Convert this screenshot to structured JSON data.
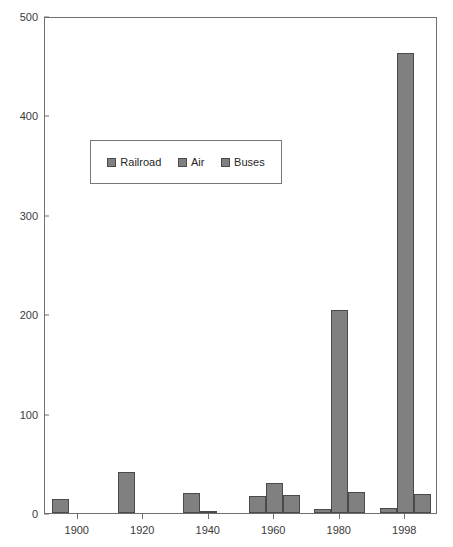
{
  "chart_data": {
    "type": "bar",
    "title": "",
    "xlabel": "",
    "ylabel": "",
    "ylim": [
      0,
      500
    ],
    "y_ticks": [
      0,
      100,
      200,
      300,
      400,
      500
    ],
    "grid": false,
    "legend_position": "upper-left-inside",
    "categories": [
      "1900",
      "1920",
      "1940",
      "1960",
      "1980",
      "1998"
    ],
    "series": [
      {
        "name": "Railroad",
        "color": "#808080",
        "values": [
          14,
          41,
          20,
          17,
          4,
          5
        ]
      },
      {
        "name": "Air",
        "color": "#808080",
        "values": [
          0,
          0,
          1,
          30,
          204,
          463
        ]
      },
      {
        "name": "Buses",
        "color": "#808080",
        "values": [
          0,
          0,
          0,
          18,
          21,
          19
        ]
      }
    ]
  },
  "axes": {
    "y_tick_labels": [
      "0",
      "100",
      "200",
      "300",
      "400",
      "500"
    ],
    "x_tick_labels": [
      "1900",
      "1920",
      "1940",
      "1960",
      "1980",
      "1998"
    ]
  },
  "legend": {
    "items": [
      {
        "label": "Railroad"
      },
      {
        "label": "Air"
      },
      {
        "label": "Buses"
      }
    ]
  },
  "title_strip": {
    "text": ""
  },
  "colors": {
    "bar_fill": "#808080",
    "bar_stroke": "#4a4a4a",
    "frame": "#6f6f6f",
    "text": "#3a3a3a"
  }
}
